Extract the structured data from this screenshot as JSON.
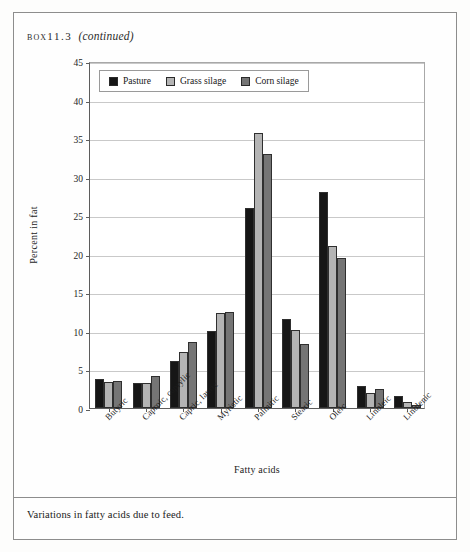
{
  "box": {
    "label": "box",
    "number": "11.3",
    "continued": "(continued)"
  },
  "caption": "Variations in fatty acids due to feed.",
  "colors": {
    "pasture": "#161616",
    "grass_silage": "#b4b4b4",
    "corn_silage": "#757575",
    "gridline": "#c9c9c9",
    "axis": "#5d5d5d"
  },
  "chart_data": {
    "type": "bar",
    "title": "",
    "xlabel": "Fatty acids",
    "ylabel": "Percent in fat",
    "ylim": [
      0,
      45
    ],
    "yticks": [
      0,
      5,
      10,
      15,
      20,
      25,
      30,
      35,
      40,
      45
    ],
    "ytick_labels": [
      "0",
      "5",
      "10",
      "15",
      "20",
      "25",
      "30",
      "35",
      "40",
      "45"
    ],
    "grid": true,
    "legend_position": "top-left-inside",
    "categories": [
      "Butyric",
      "Caproic, caprylic",
      "Capric, lauric",
      "Myristic",
      "Palmitic",
      "Stearic",
      "Oleic",
      "Linoleic",
      "Linolenic"
    ],
    "series": [
      {
        "name": "Pasture",
        "color": "#161616",
        "values": [
          3.7,
          3.3,
          6.1,
          10.0,
          25.9,
          11.5,
          28.0,
          2.9,
          1.5
        ]
      },
      {
        "name": "Grass silage",
        "color": "#b4b4b4",
        "values": [
          3.4,
          3.3,
          7.3,
          12.3,
          35.7,
          10.1,
          21.0,
          2.0,
          0.8
        ]
      },
      {
        "name": "Corn silage",
        "color": "#757575",
        "values": [
          3.5,
          4.2,
          8.6,
          12.5,
          32.9,
          8.3,
          19.5,
          2.5,
          0.4
        ]
      }
    ]
  }
}
